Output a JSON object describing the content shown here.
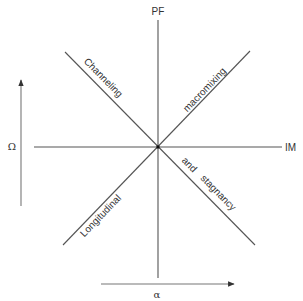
{
  "diagram": {
    "axes": {
      "vertical_label": "PF",
      "horizontal_label": "IM"
    },
    "diagonal_labels": {
      "upper_left": "Channeling",
      "upper_right": "macromixing",
      "lower_left": "Longitudinal",
      "lower_right_1": "and",
      "lower_right_2": "stagnancy"
    },
    "arrows": {
      "vertical_arrow_label": "Ω",
      "horizontal_arrow_label": "α"
    },
    "colors": {
      "line": "#555555",
      "text": "#333333",
      "background": "#ffffff"
    }
  }
}
